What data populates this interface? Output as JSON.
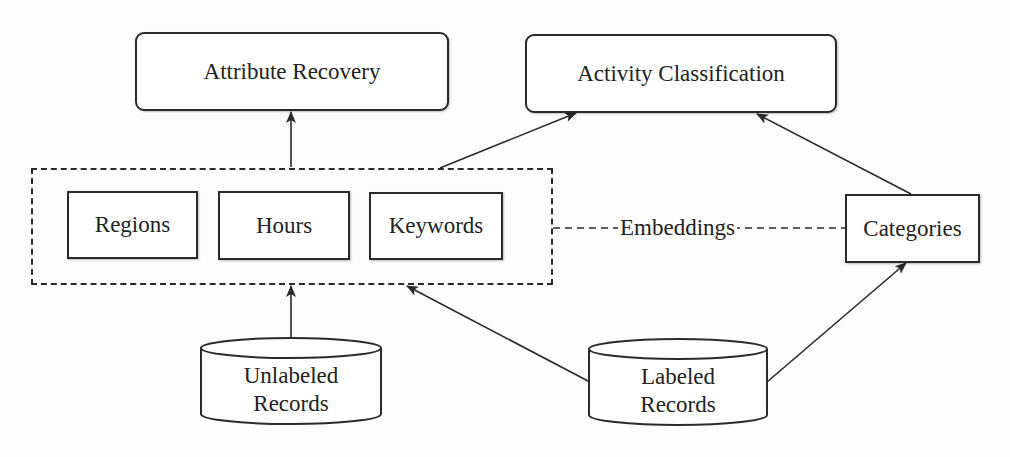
{
  "diagram": {
    "outputs": {
      "attribute_recovery": "Attribute Recovery",
      "activity_classification": "Activity Classification"
    },
    "features": {
      "regions": "Regions",
      "hours": "Hours",
      "keywords": "Keywords"
    },
    "categories": "Categories",
    "embeddings_label": "Embeddings",
    "sources": {
      "unlabeled": [
        "Unlabeled",
        "Records"
      ],
      "labeled": [
        "Labeled",
        "Records"
      ]
    },
    "colors": {
      "stroke": "#2a2a2a",
      "background": "#fdfdfd"
    },
    "edges": [
      {
        "from": "feature-group",
        "to": "attribute-recovery",
        "style": "arrow"
      },
      {
        "from": "feature-group",
        "to": "activity-classification",
        "style": "arrow"
      },
      {
        "from": "categories",
        "to": "activity-classification",
        "style": "arrow"
      },
      {
        "from": "unlabeled-records",
        "to": "feature-group",
        "style": "arrow"
      },
      {
        "from": "labeled-records",
        "to": "feature-group",
        "style": "arrow"
      },
      {
        "from": "labeled-records",
        "to": "categories",
        "style": "arrow"
      },
      {
        "from": "feature-group",
        "to": "categories",
        "style": "dashed",
        "label": "Embeddings"
      }
    ]
  }
}
